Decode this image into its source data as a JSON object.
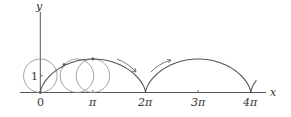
{
  "figure": {
    "axes": {
      "x_label": "x",
      "y_label": "y",
      "x_ticks": [
        "0",
        "π",
        "2π",
        "3π",
        "4π"
      ],
      "y_ticks": [
        "1"
      ]
    },
    "circles": [
      {
        "center_x": "0",
        "radius": 1
      },
      {
        "center_x": "π/2 + ...",
        "radius": 1
      },
      {
        "center_x": "π",
        "radius": 1
      }
    ],
    "arcs": [
      "0 to 2π",
      "2π to 4π",
      "partial after 4π"
    ],
    "arrows": [
      "rolling direction down-right",
      "rolling direction up-right"
    ],
    "colors": {
      "line": "#555555",
      "circle": "#888888",
      "text": "#333333"
    }
  }
}
